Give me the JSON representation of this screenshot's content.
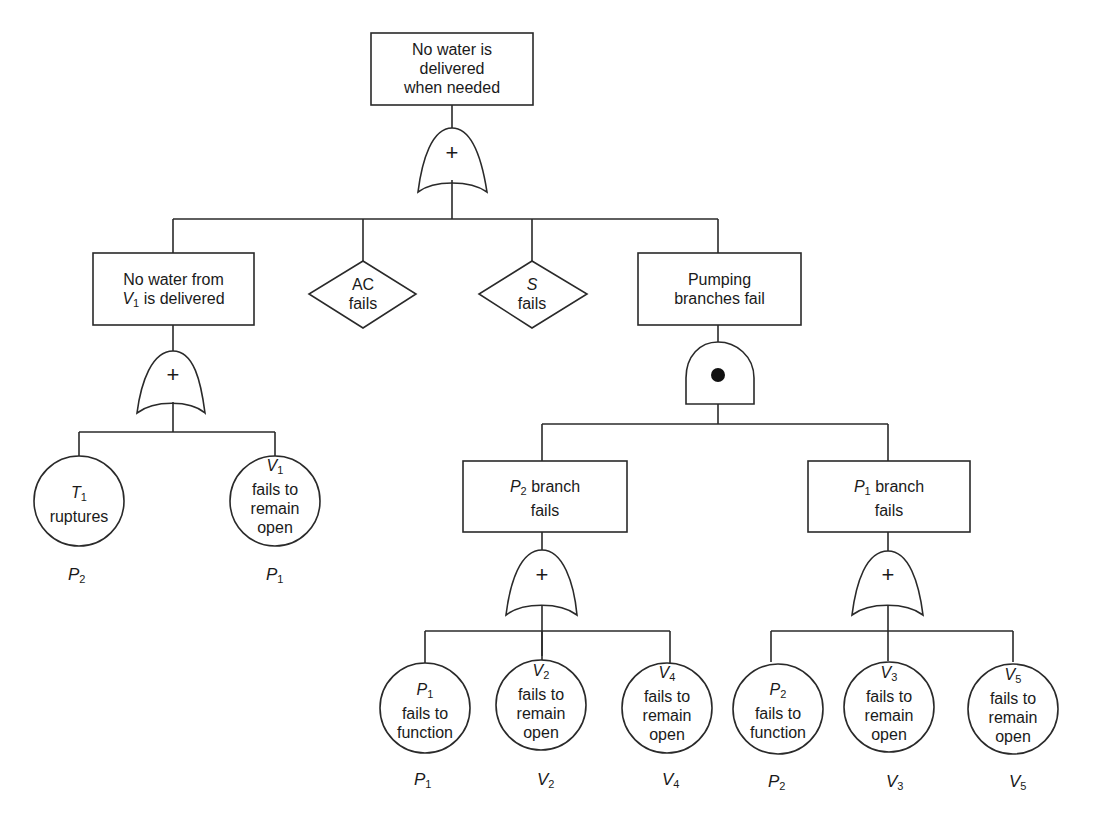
{
  "top_event": {
    "text": "No water is delivered when needed",
    "lines": [
      "No water is",
      "delivered",
      "when needed"
    ],
    "gate": "OR"
  },
  "gate_symbols": {
    "or": "+",
    "and": "●"
  },
  "level1": [
    {
      "id": "v1-branch",
      "type": "event",
      "lines": [
        "No water from",
        "is delivered"
      ],
      "prefix_var": "V",
      "prefix_sub": "1",
      "gate": "OR"
    },
    {
      "id": "ac",
      "type": "undeveloped",
      "lines": [
        "AC",
        "fails"
      ]
    },
    {
      "id": "s",
      "type": "undeveloped",
      "var": "S",
      "lines": [
        "fails"
      ]
    },
    {
      "id": "pumping",
      "type": "event",
      "lines": [
        "Pumping",
        "branches fail"
      ],
      "gate": "AND"
    }
  ],
  "v1_children": [
    {
      "type": "basic",
      "var": "T",
      "sub": "1",
      "lines": [
        "ruptures"
      ],
      "prob_var": "P",
      "prob_sub": "2"
    },
    {
      "type": "basic",
      "var": "V",
      "sub": "1",
      "lines": [
        "fails to",
        "remain",
        "open"
      ],
      "prob_var": "P",
      "prob_sub": "1"
    }
  ],
  "pumping_children": [
    {
      "id": "p2-branch",
      "type": "event",
      "var": "P",
      "sub": "2",
      "lines": [
        "branch",
        "fails"
      ],
      "gate": "OR",
      "children": [
        {
          "var": "P",
          "sub": "1",
          "lines": [
            "fails to",
            "function"
          ],
          "prob_var": "P",
          "prob_sub": "1"
        },
        {
          "var": "V",
          "sub": "2",
          "lines": [
            "fails to",
            "remain",
            "open"
          ],
          "prob_var": "V",
          "prob_sub": "2"
        },
        {
          "var": "V",
          "sub": "4",
          "lines": [
            "fails to",
            "remain",
            "open"
          ],
          "prob_var": "V",
          "prob_sub": "4"
        }
      ]
    },
    {
      "id": "p1-branch",
      "type": "event",
      "var": "P",
      "sub": "1",
      "lines": [
        "branch",
        "fails"
      ],
      "gate": "OR",
      "children": [
        {
          "var": "P",
          "sub": "2",
          "lines": [
            "fails to",
            "function"
          ],
          "prob_var": "P",
          "prob_sub": "2"
        },
        {
          "var": "V",
          "sub": "3",
          "lines": [
            "fails to",
            "remain",
            "open"
          ],
          "prob_var": "V",
          "prob_sub": "3"
        },
        {
          "var": "V",
          "sub": "5",
          "lines": [
            "fails to",
            "remain",
            "open"
          ],
          "prob_var": "V",
          "prob_sub": "5"
        }
      ]
    }
  ]
}
